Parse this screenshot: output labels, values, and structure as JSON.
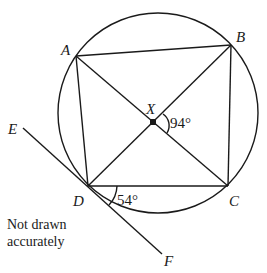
{
  "diagram": {
    "points": {
      "A": {
        "label": "A"
      },
      "B": {
        "label": "B"
      },
      "C": {
        "label": "C"
      },
      "D": {
        "label": "D"
      },
      "X": {
        "label": "X"
      },
      "E": {
        "label": "E"
      },
      "F": {
        "label": "F"
      }
    },
    "angles": {
      "BXC": "94°",
      "CDF": "54°"
    },
    "note_line1": "Not drawn",
    "note_line2": "accurately",
    "segments": [
      "AB",
      "BC",
      "CD",
      "DA",
      "AC",
      "BD",
      "EF"
    ],
    "tangent_line": "EF tangent to circle at D",
    "right_angle_marker": "X"
  }
}
